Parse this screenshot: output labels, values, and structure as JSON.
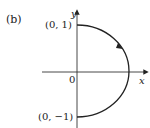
{
  "figure": {
    "panel_label": "(b)",
    "axes": {
      "x_label": "x",
      "y_label": "y",
      "origin_label": "0"
    },
    "points": [
      {
        "label": "(0, 1)"
      },
      {
        "label": "(0, −1)"
      }
    ],
    "curve": "right half of unit circle traversed clockwise from (0, 1) to (0, −1)"
  }
}
